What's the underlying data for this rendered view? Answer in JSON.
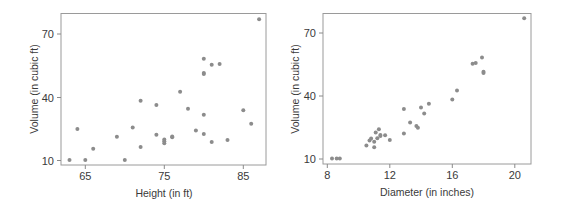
{
  "chart_data": [
    {
      "type": "scatter",
      "title": "",
      "xlabel": "Height (in ft)",
      "ylabel": "Volume (in cubic ft)",
      "xlim": [
        62,
        88
      ],
      "ylim": [
        8,
        80
      ],
      "xticks": [
        65,
        75,
        85
      ],
      "yticks": [
        10,
        40,
        70
      ],
      "grid": false,
      "point_color": "#8c8c8c",
      "x": [
        70,
        65,
        63,
        72,
        81,
        83,
        66,
        75,
        80,
        75,
        79,
        76,
        76,
        69,
        75,
        74,
        85,
        86,
        71,
        64,
        78,
        80,
        74,
        72,
        77,
        81,
        82,
        80,
        80,
        80,
        87
      ],
      "y": [
        10.3,
        10.3,
        10.2,
        16.4,
        18.8,
        19.7,
        15.6,
        18.2,
        22.6,
        19.9,
        24.2,
        21.0,
        21.4,
        21.3,
        19.1,
        22.2,
        33.8,
        27.4,
        25.7,
        24.9,
        34.5,
        31.7,
        36.3,
        38.3,
        42.6,
        55.4,
        55.7,
        58.3,
        51.5,
        51.0,
        77.0
      ]
    },
    {
      "type": "scatter",
      "title": "",
      "xlabel": "Diameter (in inches)",
      "ylabel": "Volume (in cubic ft)",
      "xlim": [
        7.8,
        21.2
      ],
      "ylim": [
        8,
        80
      ],
      "xticks": [
        8,
        12,
        16,
        20
      ],
      "yticks": [
        10,
        40,
        70
      ],
      "grid": false,
      "point_color": "#8c8c8c",
      "x": [
        8.3,
        8.6,
        8.8,
        10.5,
        10.7,
        10.8,
        11.0,
        11.0,
        11.1,
        11.2,
        11.3,
        11.4,
        11.4,
        11.7,
        12.0,
        12.9,
        12.9,
        13.3,
        13.7,
        13.8,
        14.0,
        14.2,
        14.5,
        16.0,
        16.3,
        17.3,
        17.5,
        17.9,
        18.0,
        18.0,
        20.6
      ],
      "y": [
        10.3,
        10.3,
        10.2,
        16.4,
        18.8,
        19.7,
        15.6,
        18.2,
        22.6,
        19.9,
        24.2,
        21.0,
        21.4,
        21.3,
        19.1,
        22.2,
        33.8,
        27.4,
        25.7,
        24.9,
        34.5,
        31.7,
        36.3,
        38.3,
        42.6,
        55.4,
        55.7,
        58.3,
        51.5,
        51.0,
        77.0
      ]
    }
  ],
  "plots": {
    "left": {
      "xlabel": "Height (in ft)",
      "ylabel": "Volume (in cubic ft)",
      "xticks": [
        "65",
        "75",
        "85"
      ],
      "yticks": [
        "70",
        "40",
        "10"
      ]
    },
    "right": {
      "xlabel": "Diameter (in inches)",
      "ylabel": "Volume (in cubic ft)",
      "xticks": [
        "8",
        "12",
        "16",
        "20"
      ],
      "yticks": [
        "70",
        "40",
        "10"
      ]
    }
  }
}
